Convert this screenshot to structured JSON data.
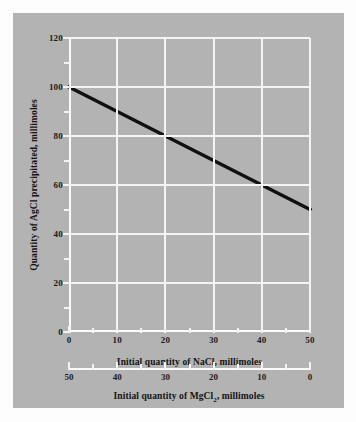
{
  "figure": {
    "background_color": "#fdfdfd",
    "panel_color": "#b3b3b3",
    "grid_color": "#f4f4f4",
    "line_color": "#101010"
  },
  "chart_data": {
    "type": "line",
    "title": "",
    "subtitle": "",
    "xlabel": "Initial quantity of NaCl, millimoles",
    "ylabel": "Quantity of AgCl precipitated, millimoles",
    "xlabel_secondary": "Initial quantity of MgCl",
    "xlabel_secondary_sub": "2",
    "xlabel_secondary_tail": ", millimoles",
    "xlim": [
      0,
      50
    ],
    "ylim": [
      0,
      120
    ],
    "xticks": [
      0,
      10,
      20,
      30,
      40,
      50
    ],
    "yticks": [
      0,
      20,
      40,
      60,
      80,
      100,
      120
    ],
    "xticks_secondary": [
      50,
      40,
      30,
      20,
      10,
      0
    ],
    "xtick_minor_step": 5,
    "ytick_minor_step": 10,
    "grid": true,
    "legend": "none",
    "series": [
      {
        "name": "AgCl precipitated",
        "x": [
          0,
          10,
          20,
          30,
          40,
          50
        ],
        "values": [
          100,
          90,
          80,
          70,
          60,
          50
        ]
      }
    ],
    "annotations": []
  },
  "ytick_labels": [
    "0",
    "20",
    "40",
    "60",
    "80",
    "100",
    "120"
  ],
  "xtick_labels": [
    "0",
    "10",
    "20",
    "30",
    "40",
    "50"
  ],
  "xtick_labels_secondary": [
    "50",
    "40",
    "30",
    "20",
    "10",
    "0"
  ]
}
